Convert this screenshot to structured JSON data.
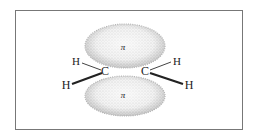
{
  "diagram": {
    "frame": {
      "x": 15,
      "y": 10,
      "width": 227,
      "height": 119,
      "stroke": "#777777"
    },
    "lobes": [
      {
        "id": "upper",
        "label": "π",
        "cx": 125,
        "cy": 47,
        "rx": 40,
        "ry": 22
      },
      {
        "id": "lower",
        "label": "π",
        "cx": 125,
        "cy": 96,
        "rx": 40,
        "ry": 20
      }
    ],
    "atoms": [
      {
        "id": "C1",
        "label": "C",
        "x": 105,
        "y": 75
      },
      {
        "id": "C2",
        "label": "C",
        "x": 145,
        "y": 75
      },
      {
        "id": "H1",
        "label": "H",
        "x": 74,
        "y": 65
      },
      {
        "id": "H2",
        "label": "H",
        "x": 65,
        "y": 89
      },
      {
        "id": "H3",
        "label": "H",
        "x": 177,
        "y": 65
      },
      {
        "id": "H4",
        "label": "H",
        "x": 188,
        "y": 89
      }
    ],
    "labels": {
      "pi_upper": "π",
      "pi_lower": "π",
      "c_left": "C",
      "c_right": "C",
      "h_upper_left": "H",
      "h_lower_left": "H",
      "h_upper_right": "H",
      "h_lower_right": "H"
    },
    "colors": {
      "lobe_fill": "#e4e4e4",
      "lobe_stipple": "#9a9a9a",
      "bond": "#222222",
      "frame": "#777777"
    }
  }
}
